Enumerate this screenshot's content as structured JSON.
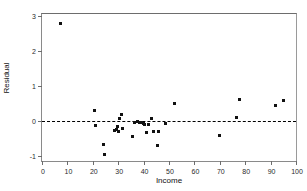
{
  "chart_data": {
    "type": "scatter",
    "title": "",
    "xlabel": "Income",
    "ylabel": "Residual",
    "xlim": [
      0,
      100
    ],
    "ylim": [
      -1.15,
      3.05
    ],
    "xticks": [
      0,
      10,
      20,
      30,
      40,
      50,
      60,
      70,
      80,
      90,
      100
    ],
    "xtick_labels": [
      "0",
      "10",
      "20",
      "30",
      "40",
      "50",
      "60",
      "70",
      "80",
      "90",
      "100"
    ],
    "yticks": [
      -1,
      0,
      1,
      2,
      3
    ],
    "ytick_labels": [
      "-1",
      "0",
      "1",
      "2",
      "3"
    ],
    "grid": false,
    "legend": false,
    "reference_line": {
      "axis": "y",
      "value": 0,
      "style": "dashed",
      "color": "#000000"
    },
    "marker": {
      "shape": "square",
      "color": "#111111",
      "size": 3
    },
    "series": [
      {
        "name": "Residuals",
        "x": [
          7.3,
          20.6,
          21.0,
          24.3,
          24.8,
          28.6,
          29.2,
          29.6,
          30.1,
          30.6,
          31.4,
          31.8,
          35.8,
          36.3,
          37.6,
          38.4,
          39.2,
          39.8,
          40.4,
          41.2,
          42.0,
          43.3,
          43.9,
          45.4,
          45.8,
          48.8,
          52.0,
          69.9,
          76.6,
          77.9,
          91.8,
          95.2
        ],
        "y": [
          2.79,
          0.3,
          -0.14,
          -0.69,
          -0.96,
          -0.27,
          -0.25,
          -0.15,
          -0.32,
          0.07,
          0.18,
          -0.21,
          -0.46,
          -0.05,
          -0.03,
          -0.04,
          -0.05,
          -0.08,
          -0.11,
          -0.33,
          -0.12,
          0.06,
          -0.31,
          -0.7,
          -0.3,
          -0.09,
          0.5,
          -0.42,
          0.09,
          0.6,
          0.43,
          0.59
        ]
      }
    ]
  },
  "axes": {
    "x_title": "Income",
    "y_title": "Residual"
  }
}
